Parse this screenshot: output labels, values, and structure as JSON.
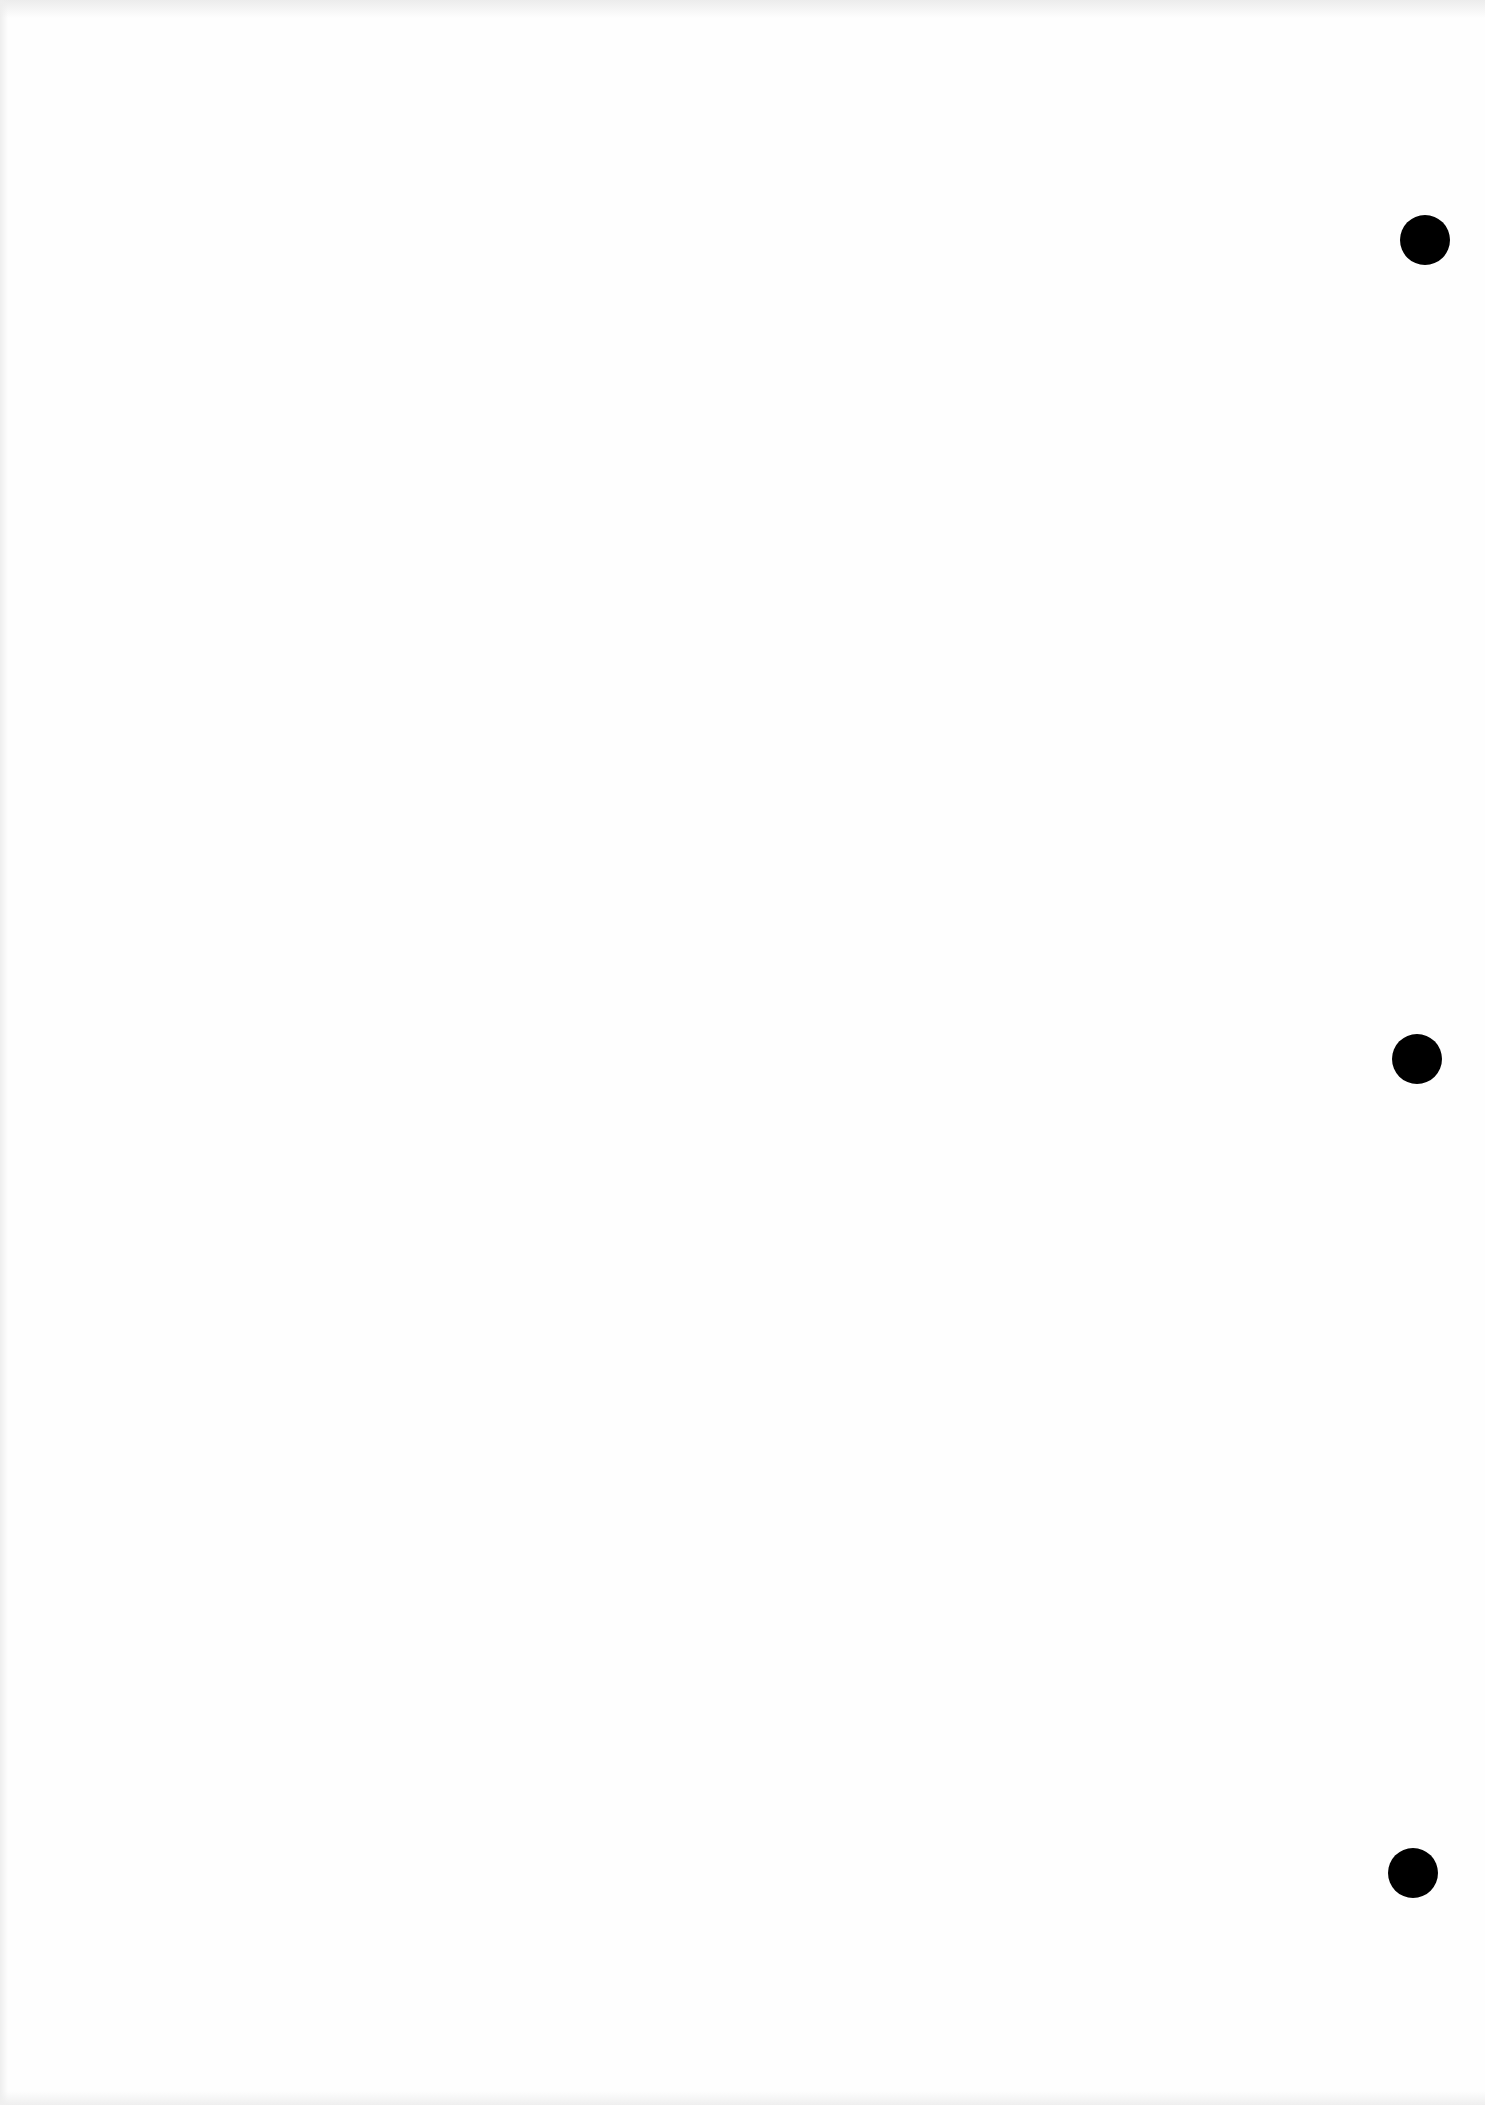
{
  "document": {
    "type": "blank scanned page",
    "text": "",
    "background_color": "#fefefe",
    "punch_holes": [
      {
        "name": "punch-hole-top",
        "x": 1400,
        "y": 215
      },
      {
        "name": "punch-hole-middle",
        "x": 1392,
        "y": 1034
      },
      {
        "name": "punch-hole-bottom",
        "x": 1388,
        "y": 1848
      }
    ],
    "hole_color": "#000000"
  }
}
